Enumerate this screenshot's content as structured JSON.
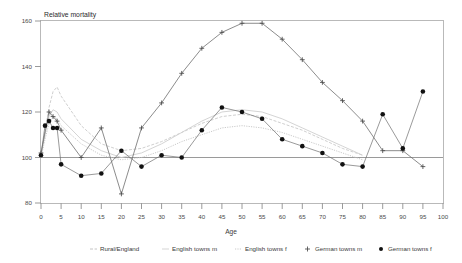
{
  "chart_data": {
    "type": "line",
    "title": "Relative mortality",
    "xlabel": "Age",
    "ylabel": "",
    "xlim": [
      0,
      100
    ],
    "ylim": [
      80,
      160
    ],
    "xticks": [
      0,
      5,
      10,
      15,
      20,
      25,
      30,
      35,
      40,
      45,
      50,
      55,
      60,
      65,
      70,
      75,
      80,
      85,
      90,
      95,
      100
    ],
    "yticks": [
      80,
      100,
      120,
      140,
      160
    ],
    "grid": false,
    "reference_line_y": 100,
    "legend_position": "bottom",
    "series": [
      {
        "name": "Rural/England",
        "style": "dashed-line",
        "color": "#c9c9c9",
        "marker": "none",
        "x": [
          0,
          1,
          2,
          3,
          4,
          5,
          10,
          15,
          20,
          25,
          30,
          35,
          40,
          45,
          50,
          55,
          60,
          65,
          70,
          75,
          80
        ],
        "values": [
          100,
          112,
          122,
          129,
          131,
          127,
          114,
          106,
          103,
          104,
          107,
          111,
          115,
          118,
          119,
          118,
          115,
          112,
          108,
          104,
          101
        ]
      },
      {
        "name": "English towns m",
        "style": "solid-line",
        "color": "#cfcfcf",
        "marker": "none",
        "x": [
          0,
          1,
          2,
          3,
          4,
          5,
          10,
          15,
          20,
          25,
          30,
          35,
          40,
          45,
          50,
          55,
          60,
          65,
          70,
          75,
          80
        ],
        "values": [
          101,
          110,
          118,
          121,
          120,
          117,
          108,
          103,
          100,
          102,
          106,
          111,
          116,
          120,
          121,
          120,
          117,
          113,
          109,
          105,
          101
        ]
      },
      {
        "name": "English towns f",
        "style": "dotted-line",
        "color": "#c4c4c4",
        "marker": "none",
        "x": [
          0,
          1,
          2,
          3,
          4,
          5,
          10,
          15,
          20,
          25,
          30,
          35,
          40,
          45,
          50,
          55,
          60,
          65,
          70,
          75,
          80
        ],
        "values": [
          100,
          108,
          115,
          118,
          117,
          114,
          106,
          101,
          99,
          100,
          103,
          107,
          110,
          113,
          114,
          113,
          111,
          108,
          105,
          102,
          99
        ]
      },
      {
        "name": "German towns m",
        "style": "solid-line-plus",
        "color": "#6e6e6e",
        "marker": "plus",
        "x": [
          0,
          2,
          3,
          4,
          5,
          10,
          15,
          20,
          25,
          30,
          35,
          40,
          45,
          50,
          55,
          60,
          65,
          70,
          75,
          80,
          85,
          90,
          95
        ],
        "values": [
          102,
          120,
          118,
          116,
          112,
          100,
          113,
          84,
          113,
          124,
          137,
          148,
          155,
          159,
          159,
          152,
          143,
          133,
          125,
          116,
          103,
          103,
          96
        ]
      },
      {
        "name": "German towns f",
        "style": "solid-line-dot",
        "color": "#111111",
        "marker": "circle",
        "x": [
          0,
          1,
          2,
          3,
          4,
          5,
          10,
          15,
          20,
          25,
          30,
          35,
          40,
          45,
          50,
          55,
          60,
          65,
          70,
          75,
          80,
          85,
          90,
          95
        ],
        "values": [
          101,
          114,
          116,
          113,
          113,
          97,
          92,
          93,
          103,
          96,
          101,
          100,
          112,
          122,
          120,
          117,
          108,
          105,
          102,
          97,
          96,
          119,
          104,
          129
        ]
      }
    ]
  },
  "legend": {
    "items": [
      {
        "label": "Rural/England",
        "marker": "dashed-line-swatch"
      },
      {
        "label": "English towns m",
        "marker": "line-swatch"
      },
      {
        "label": "English towns f",
        "marker": "dotted-line-swatch"
      },
      {
        "label": "German towns m",
        "marker": "plus-swatch"
      },
      {
        "label": "German towns f",
        "marker": "circle-swatch"
      }
    ]
  },
  "axes": {
    "y_labels": [
      "160",
      "140",
      "120",
      "100",
      "80"
    ],
    "x_labels": [
      "0",
      "5",
      "10",
      "15",
      "20",
      "25",
      "30",
      "35",
      "40",
      "45",
      "50",
      "55",
      "60",
      "65",
      "70",
      "75",
      "80",
      "85",
      "90",
      "95",
      "100"
    ],
    "x_title": "Age",
    "plot_title": "Relative mortality"
  }
}
